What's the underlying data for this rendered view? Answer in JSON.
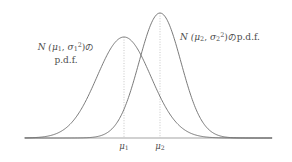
{
  "figure": {
    "background_color": "#ffffff",
    "curve_color": "#6b6b6b",
    "axis_color": "#c2c2c2",
    "guide_color": "#b9b9b9",
    "text_color": "#4d4d4d"
  },
  "labels": {
    "dist1": {
      "prefix": "N (",
      "mu": "μ",
      "mu_sub": "1",
      "comma": ", ",
      "sigma": "σ",
      "sigma_sub": "1",
      "sigma_sup": "2",
      "suffix": ")",
      "particle": "の",
      "pdf": "p.d.f.",
      "full_text": "N (μ₁, σ₁²) の p.d.f."
    },
    "dist2": {
      "prefix": "N (",
      "mu": "μ",
      "mu_sub": "2",
      "comma": ", ",
      "sigma": "σ",
      "sigma_sub": "2",
      "sigma_sup": "2",
      "suffix": ")",
      "particle": "の",
      "pdf": "p.d.f.",
      "full_text": "N (μ₂, σ₂²) の p.d.f."
    }
  },
  "ticks": [
    {
      "name": "mu-1",
      "symbol": "μ",
      "subscript": "1",
      "x": 124
    },
    {
      "name": "mu-2",
      "symbol": "μ",
      "subscript": "2",
      "x": 160
    }
  ],
  "chart_data": {
    "type": "line",
    "title": "",
    "xlabel": "",
    "ylabel": "",
    "grid": false,
    "legend_position": "inline-annotations",
    "axis": {
      "baseline_y": 138,
      "x_start": 25,
      "x_end": 272
    },
    "series": [
      {
        "name": "N (μ₁, σ₁²) p.d.f.",
        "mean_px": 124,
        "peak_y_px": 37,
        "sigma_px": 27,
        "relative_peak_height": 0.795,
        "relative_width": "wider",
        "color": "#6b6b6b"
      },
      {
        "name": "N (μ₂, σ₂²) p.d.f.",
        "mean_px": 160,
        "peak_y_px": 13,
        "sigma_px": 21,
        "relative_peak_height": 1.0,
        "relative_width": "narrower",
        "color": "#6b6b6b"
      }
    ],
    "annotations": [
      {
        "text": "N (μ₁, σ₁²) の p.d.f.",
        "target_series": 0
      },
      {
        "text": "N (μ₂, σ₂²) の p.d.f.",
        "target_series": 1
      }
    ]
  }
}
